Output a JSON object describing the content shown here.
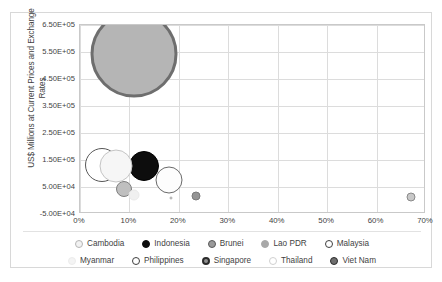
{
  "chart_data": {
    "type": "scatter",
    "title": "",
    "xlabel": "",
    "ylabel": "US$ Millions at Current Prices and Exchange Rates",
    "ylabel_line1": "US$ Millions at Current Prices and Exchange",
    "ylabel_line2": "Rates",
    "xlim": [
      0,
      70
    ],
    "ylim": [
      -50000,
      650000
    ],
    "x_tick_labels": [
      "0%",
      "10%",
      "20%",
      "30%",
      "40%",
      "50%",
      "60%",
      "70%"
    ],
    "x_tick_values": [
      0,
      10,
      20,
      30,
      40,
      50,
      60,
      70
    ],
    "y_tick_labels": [
      "6.50E+05",
      "5.50E+05",
      "4.50E+05",
      "3.50E+05",
      "2.50E+05",
      "1.50E+05",
      "5.00E+04",
      "-5.00E+04"
    ],
    "y_tick_values": [
      650000,
      550000,
      450000,
      350000,
      250000,
      150000,
      50000,
      -50000
    ],
    "grid": true,
    "legend_position": "bottom",
    "points": [
      {
        "name": "Cambodia",
        "x": 18.5,
        "y": 8000,
        "size": 3,
        "fill": "#f2f2f2",
        "stroke": "#a6a6a6",
        "stroke_width": 0.8
      },
      {
        "name": "Indonesia",
        "x": 13.0,
        "y": 128000,
        "size": 30,
        "fill": "#0d0d0d",
        "stroke": "#000000",
        "stroke_width": 1
      },
      {
        "name": "Brunei",
        "x": 9.0,
        "y": 42000,
        "size": 16,
        "fill": "#bfbfbf",
        "stroke": "#7f7f7f",
        "stroke_width": 1.6
      },
      {
        "name": "Lao PDR",
        "x": 23.5,
        "y": 15000,
        "size": 9,
        "fill": "#949494",
        "stroke": "#7a7a7a",
        "stroke_width": 0.8
      },
      {
        "name": "Malaysia",
        "x": 4.5,
        "y": 132000,
        "size": 34,
        "fill": "#ffffff",
        "stroke": "#585858",
        "stroke_width": 1
      },
      {
        "name": "Myanmar",
        "x": 11.0,
        "y": 22000,
        "size": 11,
        "fill": "#f0f0f0",
        "stroke": "#eaeaea",
        "stroke_width": 0.8
      },
      {
        "name": "Philippines",
        "x": 18.0,
        "y": 77000,
        "size": 27,
        "fill": "#fdfdfd",
        "stroke": "#6b6b6b",
        "stroke_width": 1.4
      },
      {
        "name": "Singapore",
        "x": 11.0,
        "y": 542000,
        "size": 87,
        "fill": "#b5b5b5",
        "stroke": "#6e6e6e",
        "stroke_width": 3
      },
      {
        "name": "Thailand",
        "x": 7.2,
        "y": 128000,
        "size": 33,
        "fill": "#f6f6f6",
        "stroke": "#c4c4c4",
        "stroke_width": 1.2
      },
      {
        "name": "Viet Nam",
        "x": 67.0,
        "y": 12000,
        "size": 9,
        "fill": "#c8c8c8",
        "stroke": "#8a8a8a",
        "stroke_width": 1.4
      }
    ]
  },
  "legend": {
    "row1": [
      {
        "label": "Cambodia",
        "fill": "#f2f2f2",
        "stroke": "#b5b5b5",
        "stroke_width": 1.4
      },
      {
        "label": "Indonesia",
        "fill": "#0d0d0d",
        "stroke": "#0d0d0d",
        "stroke_width": 1
      },
      {
        "label": "Brunei",
        "fill": "#9a9a9a",
        "stroke": "#595959",
        "stroke_width": 1.6
      },
      {
        "label": "Lao PDR",
        "fill": "#a8a8a8",
        "stroke": "#a8a8a8",
        "stroke_width": 1
      },
      {
        "label": "Malaysia",
        "fill": "#ffffff",
        "stroke": "#3f3f3f",
        "stroke_width": 1.6
      }
    ],
    "row2": [
      {
        "label": "Myanmar",
        "fill": "#f4f4f4",
        "stroke": "#ececec",
        "stroke_width": 1
      },
      {
        "label": "Philippines",
        "fill": "#ffffff",
        "stroke": "#3f3f3f",
        "stroke_width": 1.6
      },
      {
        "label": "Singapore",
        "fill": "#8f8f8f",
        "stroke": "#2b2b2b",
        "stroke_width": 2
      },
      {
        "label": "Thailand",
        "fill": "#ffffff",
        "stroke": "#d0d0d0",
        "stroke_width": 1.2
      },
      {
        "label": "Viet Nam",
        "fill": "#6e6e6e",
        "stroke": "#2b2b2b",
        "stroke_width": 1.8
      }
    ]
  },
  "colors": {
    "grid": "#dcdcdc",
    "plot_border": "#c9c9c9",
    "frame_border": "#d8d8d8",
    "text": "#3f3f3f",
    "background": "#ffffff"
  }
}
